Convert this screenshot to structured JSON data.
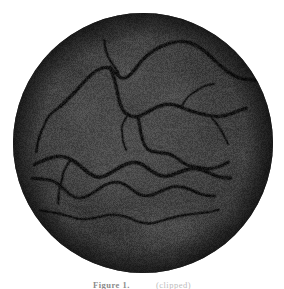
{
  "page": {
    "background_color": "#ffffff",
    "width": 284,
    "height": 289
  },
  "figure": {
    "name": "retinal-fundus-photograph",
    "modality": "Fundus photograph (grayscale)",
    "shape": "circle",
    "center_x": 143,
    "center_y": 143,
    "radius": 130,
    "base_color": "#3e3e3e",
    "vessel_color": "#141414",
    "optic_disc_color": "#e8e8e8"
  },
  "caption": {
    "label": "Figure 1.",
    "text": "(clipped)"
  },
  "chart_data": {
    "type": "scatter",
    "xlabel": "",
    "ylabel": "",
    "grid": false,
    "legend": "none",
    "xlim": [
      0,
      260
    ],
    "ylim": [
      0,
      260
    ],
    "annotations": [
      {
        "name": "optic-disc",
        "label": "Optic disc (bright region)",
        "cx": 232,
        "cy": 83,
        "rx": 17,
        "ry": 23,
        "brightness": "#e8e8e8"
      },
      {
        "name": "macula-pale-patch",
        "label": "Central pale patch",
        "cx": 122,
        "cy": 112,
        "rx": 30,
        "ry": 22,
        "brightness": "#5c5c5c"
      }
    ],
    "series": [
      {
        "name": "vessel-superior-arcade",
        "width": 3.0,
        "points": [
          [
            46,
            92
          ],
          [
            60,
            80
          ],
          [
            72,
            68
          ],
          [
            84,
            58
          ],
          [
            96,
            53
          ],
          [
            104,
            58
          ],
          [
            110,
            66
          ],
          [
            118,
            62
          ],
          [
            126,
            50
          ],
          [
            136,
            40
          ],
          [
            148,
            32
          ],
          [
            160,
            28
          ],
          [
            172,
            28
          ],
          [
            184,
            33
          ],
          [
            196,
            43
          ],
          [
            208,
            54
          ],
          [
            220,
            62
          ],
          [
            232,
            66
          ],
          [
            244,
            68
          ]
        ]
      },
      {
        "name": "vessel-superior-branch-left",
        "width": 2.2,
        "points": [
          [
            46,
            92
          ],
          [
            38,
            100
          ],
          [
            30,
            112
          ],
          [
            26,
            126
          ],
          [
            24,
            140
          ]
        ]
      },
      {
        "name": "vessel-superior-branch-nasal",
        "width": 2.0,
        "points": [
          [
            104,
            58
          ],
          [
            98,
            48
          ],
          [
            94,
            38
          ],
          [
            92,
            28
          ]
        ]
      },
      {
        "name": "vessel-temporal-mid",
        "width": 3.0,
        "points": [
          [
            96,
            53
          ],
          [
            100,
            66
          ],
          [
            104,
            80
          ],
          [
            108,
            92
          ],
          [
            114,
            100
          ],
          [
            124,
            104
          ],
          [
            134,
            100
          ],
          [
            144,
            94
          ],
          [
            156,
            90
          ],
          [
            168,
            92
          ],
          [
            178,
            98
          ],
          [
            188,
            102
          ],
          [
            198,
            104
          ],
          [
            210,
            102
          ],
          [
            222,
            98
          ],
          [
            234,
            96
          ]
        ]
      },
      {
        "name": "vessel-mid-descending",
        "width": 2.8,
        "points": [
          [
            124,
            104
          ],
          [
            126,
            116
          ],
          [
            130,
            128
          ],
          [
            136,
            136
          ],
          [
            146,
            140
          ],
          [
            156,
            142
          ],
          [
            166,
            146
          ],
          [
            176,
            152
          ],
          [
            186,
            156
          ],
          [
            196,
            156
          ],
          [
            206,
            152
          ],
          [
            216,
            150
          ]
        ]
      },
      {
        "name": "vessel-inferior-arcade-main",
        "width": 3.2,
        "points": [
          [
            20,
            150
          ],
          [
            32,
            146
          ],
          [
            44,
            144
          ],
          [
            56,
            146
          ],
          [
            68,
            152
          ],
          [
            78,
            160
          ],
          [
            88,
            164
          ],
          [
            98,
            160
          ],
          [
            108,
            154
          ],
          [
            118,
            150
          ],
          [
            128,
            150
          ],
          [
            138,
            156
          ],
          [
            148,
            162
          ],
          [
            158,
            164
          ],
          [
            168,
            160
          ],
          [
            178,
            156
          ],
          [
            188,
            156
          ],
          [
            198,
            160
          ],
          [
            208,
            164
          ],
          [
            218,
            166
          ]
        ]
      },
      {
        "name": "vessel-inferior-secondary",
        "width": 2.6,
        "points": [
          [
            18,
            164
          ],
          [
            30,
            166
          ],
          [
            42,
            170
          ],
          [
            52,
            178
          ],
          [
            62,
            184
          ],
          [
            72,
            184
          ],
          [
            82,
            178
          ],
          [
            92,
            172
          ],
          [
            102,
            170
          ],
          [
            112,
            172
          ],
          [
            122,
            178
          ],
          [
            132,
            182
          ],
          [
            142,
            182
          ],
          [
            152,
            178
          ],
          [
            162,
            174
          ],
          [
            172,
            174
          ],
          [
            182,
            178
          ],
          [
            192,
            182
          ],
          [
            202,
            184
          ]
        ]
      },
      {
        "name": "vessel-inferior-lower",
        "width": 2.0,
        "points": [
          [
            26,
            196
          ],
          [
            40,
            200
          ],
          [
            54,
            204
          ],
          [
            68,
            206
          ],
          [
            82,
            204
          ],
          [
            96,
            202
          ],
          [
            110,
            204
          ],
          [
            124,
            208
          ],
          [
            138,
            210
          ],
          [
            152,
            208
          ],
          [
            166,
            204
          ],
          [
            180,
            200
          ],
          [
            194,
            198
          ],
          [
            206,
            198
          ]
        ]
      },
      {
        "name": "vessel-inferior-nasal-branch",
        "width": 1.8,
        "points": [
          [
            56,
            146
          ],
          [
            52,
            156
          ],
          [
            48,
            168
          ],
          [
            46,
            180
          ],
          [
            46,
            192
          ]
        ]
      },
      {
        "name": "vessel-temporal-fine-1",
        "width": 1.6,
        "points": [
          [
            168,
            92
          ],
          [
            174,
            84
          ],
          [
            182,
            78
          ],
          [
            192,
            74
          ],
          [
            202,
            72
          ]
        ]
      },
      {
        "name": "vessel-temporal-fine-2",
        "width": 1.6,
        "points": [
          [
            198,
            104
          ],
          [
            206,
            112
          ],
          [
            212,
            122
          ],
          [
            216,
            132
          ]
        ]
      },
      {
        "name": "vessel-macular-fine",
        "width": 1.4,
        "points": [
          [
            114,
            100
          ],
          [
            110,
            110
          ],
          [
            108,
            120
          ],
          [
            110,
            130
          ],
          [
            114,
            138
          ]
        ]
      }
    ]
  }
}
